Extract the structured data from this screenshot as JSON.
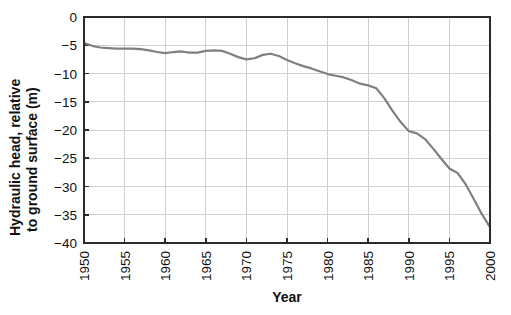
{
  "chart_data": {
    "type": "line",
    "title": "",
    "xlabel": "Year",
    "ylabel": "Hydraulic head, relative to ground surface (m)",
    "ylabel_line1": "Hydraulic head, relative",
    "ylabel_line2": "to ground surface (m)",
    "xlim": [
      1950,
      2000
    ],
    "ylim": [
      -40,
      0
    ],
    "grid": true,
    "legend": "none",
    "line_color": "#808080",
    "axis_color": "#2b2b2b",
    "grid_color": "#cfcfcf",
    "xticks": [
      1950,
      1955,
      1960,
      1965,
      1970,
      1975,
      1980,
      1985,
      1990,
      1995,
      2000
    ],
    "xtick_labels": [
      "1950",
      "1955",
      "1960",
      "1965",
      "1970",
      "1975",
      "1980",
      "1985",
      "1990",
      "1995",
      "2000"
    ],
    "xtick_rotation": 90,
    "yticks": [
      0,
      -5,
      -10,
      -15,
      -20,
      -25,
      -30,
      -35,
      -40
    ],
    "ytick_labels": [
      "0",
      "−5",
      "−10",
      "−15",
      "−20",
      "−25",
      "−30",
      "−35",
      "−40"
    ],
    "series": [
      {
        "name": "Hydraulic head",
        "x": [
          1950,
          1951,
          1952,
          1953,
          1954,
          1955,
          1956,
          1957,
          1958,
          1959,
          1960,
          1961,
          1962,
          1963,
          1964,
          1965,
          1966,
          1967,
          1968,
          1969,
          1970,
          1971,
          1972,
          1973,
          1974,
          1975,
          1976,
          1977,
          1978,
          1979,
          1980,
          1981,
          1982,
          1983,
          1984,
          1985,
          1986,
          1987,
          1988,
          1989,
          1990,
          1991,
          1992,
          1993,
          1994,
          1995,
          1996,
          1997,
          1998,
          1999,
          2000
        ],
        "values": [
          -4.6,
          -5.1,
          -5.4,
          -5.5,
          -5.6,
          -5.6,
          -5.6,
          -5.7,
          -5.9,
          -6.2,
          -6.4,
          -6.2,
          -6.1,
          -6.3,
          -6.3,
          -6.0,
          -5.9,
          -6.0,
          -6.5,
          -7.1,
          -7.5,
          -7.3,
          -6.7,
          -6.5,
          -6.9,
          -7.6,
          -8.2,
          -8.7,
          -9.1,
          -9.6,
          -10.1,
          -10.4,
          -10.7,
          -11.2,
          -11.8,
          -12.1,
          -12.6,
          -14.4,
          -16.6,
          -18.6,
          -20.2,
          -20.6,
          -21.6,
          -23.3,
          -25.1,
          -26.8,
          -27.6,
          -29.6,
          -32.2,
          -34.9,
          -37.2
        ]
      }
    ]
  },
  "labels": {
    "x_axis_title": "Year",
    "y_axis_title_line1": "Hydraulic head, relative",
    "y_axis_title_line2": "to ground surface (m)"
  }
}
